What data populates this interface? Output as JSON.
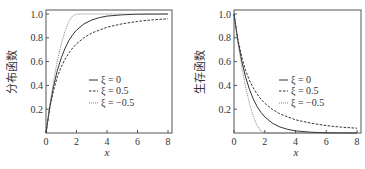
{
  "chart_data": [
    {
      "type": "line",
      "title": "",
      "xlabel": "x",
      "ylabel": "分布函数",
      "xlim": [
        0,
        8.3
      ],
      "ylim": [
        0,
        1.05
      ],
      "xticks": [
        "0",
        "2",
        "4",
        "6",
        "8"
      ],
      "yticks": [
        "0.2",
        "0.4",
        "0.6",
        "0.8",
        "1.0"
      ],
      "grid": false,
      "legend_position": "center-right",
      "x": [
        0,
        0.25,
        0.5,
        0.75,
        1,
        1.25,
        1.5,
        1.75,
        2,
        2.5,
        3,
        3.5,
        4,
        5,
        6,
        7,
        8
      ],
      "series": [
        {
          "name": "ξ = 0",
          "style": "solid",
          "values": [
            0,
            0.221,
            0.393,
            0.528,
            0.632,
            0.713,
            0.777,
            0.826,
            0.865,
            0.918,
            0.95,
            0.97,
            0.982,
            0.993,
            0.998,
            0.999,
            1.0
          ]
        },
        {
          "name": "ξ = 0.5",
          "style": "dashed",
          "values": [
            0,
            0.21,
            0.36,
            0.473,
            0.556,
            0.621,
            0.673,
            0.714,
            0.75,
            0.802,
            0.84,
            0.865,
            0.889,
            0.918,
            0.938,
            0.951,
            0.96
          ]
        },
        {
          "name": "ξ = −0.5",
          "style": "dotted",
          "values": [
            0,
            0.234,
            0.438,
            0.609,
            0.75,
            0.859,
            0.938,
            0.984,
            1.0,
            1.0,
            1.0,
            1.0,
            1.0,
            1.0,
            1.0,
            1.0,
            1.0
          ]
        }
      ]
    },
    {
      "type": "line",
      "title": "",
      "xlabel": "x",
      "ylabel": "生存函数",
      "xlim": [
        0,
        8.3
      ],
      "ylim": [
        0,
        1.05
      ],
      "xticks": [
        "0",
        "2",
        "4",
        "6",
        "8"
      ],
      "yticks": [
        "0.2",
        "0.4",
        "0.6",
        "0.8",
        "1.0"
      ],
      "grid": false,
      "legend_position": "center-right",
      "x": [
        0,
        0.25,
        0.5,
        0.75,
        1,
        1.25,
        1.5,
        1.75,
        2,
        2.5,
        3,
        3.5,
        4,
        5,
        6,
        7,
        8
      ],
      "series": [
        {
          "name": "ξ = 0",
          "style": "solid",
          "values": [
            1,
            0.779,
            0.607,
            0.472,
            0.368,
            0.287,
            0.223,
            0.174,
            0.135,
            0.082,
            0.05,
            0.03,
            0.018,
            0.007,
            0.002,
            0.001,
            0.0
          ]
        },
        {
          "name": "ξ = 0.5",
          "style": "dashed",
          "values": [
            1,
            0.79,
            0.64,
            0.527,
            0.444,
            0.379,
            0.327,
            0.286,
            0.25,
            0.198,
            0.16,
            0.135,
            0.111,
            0.082,
            0.062,
            0.049,
            0.04
          ]
        },
        {
          "name": "ξ = −0.5",
          "style": "dotted",
          "values": [
            1,
            0.766,
            0.563,
            0.391,
            0.25,
            0.141,
            0.063,
            0.016,
            0.0,
            0.0,
            0.0,
            0.0,
            0.0,
            0.0,
            0.0,
            0.0,
            0.0
          ]
        }
      ]
    }
  ],
  "left": {
    "ylabel": "分布函数",
    "xlabel": "x",
    "legend": [
      "ξ = 0",
      "ξ = 0.5",
      "ξ = −0.5"
    ]
  },
  "right": {
    "ylabel": "生存函数",
    "xlabel": "x",
    "legend": [
      "ξ = 0",
      "ξ = 0.5",
      "ξ = −0.5"
    ]
  }
}
